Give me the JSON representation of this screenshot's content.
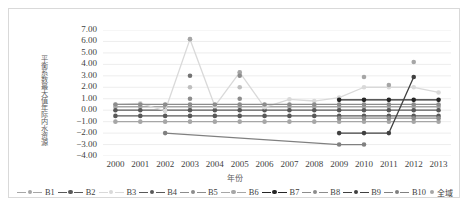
{
  "chart_data": {
    "type": "line",
    "title": "",
    "xlabel": "年份",
    "ylabel": "年际内水资源平衡系数最大值",
    "categories": [
      "2000",
      "2001",
      "2002",
      "2003",
      "2004",
      "2005",
      "2006",
      "2007",
      "2008",
      "2009",
      "2010",
      "2011",
      "2012",
      "2013"
    ],
    "ylim": [
      -4.0,
      7.0
    ],
    "ytick_step": 1.0,
    "yticks": [
      "7.00",
      "6.00",
      "5.00",
      "4.00",
      "3.00",
      "2.00",
      "1.00",
      "0.00",
      "-1.00",
      "-2.00",
      "-3.00",
      "-4.00"
    ],
    "grid": true,
    "legend_position": "bottom",
    "series": [
      {
        "name": "B1",
        "color": "#a6a6a6",
        "marker": "circle",
        "values": [
          0.3,
          0.3,
          0.3,
          0.3,
          0.3,
          0.3,
          0.3,
          0.3,
          0.3,
          0.3,
          0.3,
          0.3,
          0.3,
          0.3
        ]
      },
      {
        "name": "B2",
        "color": "#595959",
        "marker": "circle",
        "values": [
          0.0,
          0.0,
          0.0,
          0.0,
          0.0,
          0.0,
          0.0,
          0.0,
          0.0,
          0.0,
          0.0,
          0.0,
          0.0,
          0.0
        ]
      },
      {
        "name": "B3",
        "color": "#d9d9d9",
        "marker": "circle",
        "values": [
          0.5,
          0.6,
          -0.05,
          6.2,
          0.35,
          3.3,
          0.25,
          0.95,
          0.8,
          1.1,
          2.0,
          2.0,
          2.0,
          1.55
        ]
      },
      {
        "name": "B4",
        "color": "#595959",
        "marker": "circle",
        "values": [
          -0.5,
          -0.5,
          -0.5,
          -0.5,
          -0.5,
          -0.5,
          -0.5,
          -0.5,
          -0.5,
          -0.5,
          -0.5,
          -0.5,
          -0.5,
          -0.5
        ]
      },
      {
        "name": "B5",
        "color": "#8c8c8c",
        "marker": "circle",
        "values": [
          0.5,
          0.5,
          0.5,
          0.5,
          0.5,
          0.5,
          0.5,
          0.5,
          0.5,
          0.5,
          0.5,
          0.5,
          0.5,
          0.5
        ]
      },
      {
        "name": "B6",
        "color": "#a6a6a6",
        "marker": "circle",
        "values": [
          -1.0,
          -1.0,
          -1.0,
          -1.0,
          -1.0,
          -1.0,
          -1.0,
          -1.0,
          -1.0,
          -1.0,
          -1.0,
          -1.0,
          -1.0,
          -1.0
        ]
      },
      {
        "name": "B7",
        "color": "#262626",
        "marker": "circle",
        "values": [
          null,
          null,
          null,
          null,
          null,
          null,
          null,
          null,
          null,
          0.9,
          0.9,
          0.9,
          0.9,
          0.9
        ]
      },
      {
        "name": "B8",
        "color": "#8c8c8c",
        "marker": "circle",
        "values": [
          null,
          null,
          null,
          null,
          null,
          null,
          null,
          null,
          null,
          -0.7,
          -0.7,
          -0.7,
          -0.7,
          -0.7
        ]
      },
      {
        "name": "B9",
        "color": "#404040",
        "marker": "circle",
        "values": [
          null,
          null,
          null,
          null,
          null,
          null,
          null,
          null,
          null,
          -2.0,
          -2.0,
          -2.0,
          2.9,
          null
        ]
      },
      {
        "name": "B10",
        "color": "#808080",
        "marker": "circle",
        "values": [
          null,
          null,
          -2.0,
          null,
          null,
          null,
          null,
          null,
          null,
          -3.0,
          -3.0,
          null,
          null,
          null
        ]
      },
      {
        "name": "全域",
        "color": "#a6a6a6",
        "marker": "circle",
        "line": false,
        "values": [
          null,
          null,
          null,
          6.2,
          null,
          3.3,
          null,
          null,
          null,
          null,
          2.9,
          2.2,
          4.2,
          null
        ]
      }
    ],
    "extra_markers": [
      {
        "x": "2003",
        "y": 3.0,
        "color": "#737373"
      },
      {
        "x": "2003",
        "y": 2.0,
        "color": "#bfbfbf"
      },
      {
        "x": "2003",
        "y": 1.0,
        "color": "#8c8c8c"
      },
      {
        "x": "2005",
        "y": 3.0,
        "color": "#8c8c8c"
      },
      {
        "x": "2005",
        "y": 2.0,
        "color": "#bfbfbf"
      },
      {
        "x": "2005",
        "y": 1.0,
        "color": "#8c8c8c"
      }
    ]
  },
  "legend": {
    "items": [
      {
        "label": "B1",
        "color": "#a6a6a6",
        "has_line": true
      },
      {
        "label": "B2",
        "color": "#595959",
        "has_line": true
      },
      {
        "label": "B3",
        "color": "#d9d9d9",
        "has_line": true
      },
      {
        "label": "B4",
        "color": "#595959",
        "has_line": true
      },
      {
        "label": "B5",
        "color": "#8c8c8c",
        "has_line": true
      },
      {
        "label": "B6",
        "color": "#a6a6a6",
        "has_line": true
      },
      {
        "label": "B7",
        "color": "#262626",
        "has_line": true
      },
      {
        "label": "B8",
        "color": "#8c8c8c",
        "has_line": true
      },
      {
        "label": "B9",
        "color": "#404040",
        "has_line": true
      },
      {
        "label": "B10",
        "color": "#808080",
        "has_line": true
      },
      {
        "label": "全域",
        "color": "#a6a6a6",
        "has_line": false
      }
    ]
  },
  "axis": {
    "y_title_chars": "年际内水资源\n平衡系数最大值",
    "y_title_line1": "年际内水资源",
    "y_title_line2": "平衡系数最大值",
    "x_title": "年份"
  }
}
